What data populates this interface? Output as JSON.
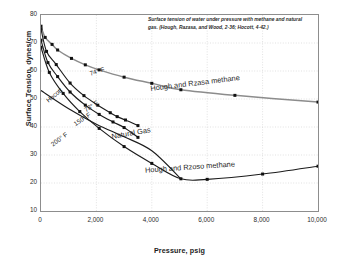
{
  "figure": {
    "caption": "Surface tension of water under pressure with methane and natural gas. (Hough, Razasa, and Wood, 2-36; Hocott, 4-42.)"
  },
  "chart_data": {
    "type": "line",
    "title": "",
    "xlabel": "Pressure, psig",
    "ylabel": "Surface Tension, dynes/cm",
    "xlim": [
      0,
      10000
    ],
    "ylim": [
      10,
      80
    ],
    "xticks": [
      "0",
      "2,000",
      "4,000",
      "6,000",
      "8,000",
      "10,000"
    ],
    "xtick_values": [
      0,
      2000,
      4000,
      6000,
      8000,
      10000
    ],
    "yticks": [
      "10",
      "20",
      "30",
      "40",
      "50",
      "60",
      "70",
      "80"
    ],
    "ytick_values": [
      10,
      20,
      30,
      40,
      50,
      60,
      70,
      80
    ],
    "grid": "dotted",
    "legend": "inline-annotations",
    "colors": {
      "methane_74F": "#8c8c8c",
      "dark_curves": "#1c1c1c",
      "frame": "#8d8d8d",
      "gridline": "#cfcfcf",
      "marker": "#111111"
    },
    "series": [
      {
        "name": "Hough and Rzasa methane",
        "label": "74° F",
        "color": "#8c8c8c",
        "markers": true,
        "points": [
          [
            0,
            76.0
          ],
          [
            150,
            72.0
          ],
          [
            400,
            69.5
          ],
          [
            600,
            67.5
          ],
          [
            1100,
            64.5
          ],
          [
            1600,
            62.2
          ],
          [
            2100,
            60.4
          ],
          [
            3000,
            57.8
          ],
          [
            4000,
            55.6
          ],
          [
            5050,
            53.3
          ],
          [
            7000,
            51.3
          ],
          [
            10000,
            48.9
          ]
        ]
      },
      {
        "name": "Hocott 78 F",
        "label": "78° F",
        "color": "#1c1c1c",
        "markers": true,
        "points": [
          [
            0,
            75.0
          ],
          [
            200,
            67.0
          ],
          [
            550,
            62.3
          ],
          [
            1050,
            55.7
          ],
          [
            1550,
            51.2
          ],
          [
            2050,
            47.8
          ],
          [
            2500,
            45.1
          ],
          [
            2750,
            43.7
          ],
          [
            3050,
            42.5
          ],
          [
            3500,
            40.5
          ]
        ]
      },
      {
        "name": "Hocott 150 F",
        "label": "150° F",
        "color": "#1c1c1c",
        "markers": true,
        "points": [
          [
            0,
            71.0
          ],
          [
            250,
            63.0
          ],
          [
            600,
            58.0
          ],
          [
            1050,
            52.5
          ],
          [
            1600,
            47.8
          ],
          [
            2100,
            44.5
          ],
          [
            2600,
            41.8
          ],
          [
            3000,
            39.8
          ],
          [
            3500,
            36.3
          ]
        ]
      },
      {
        "name": "Hough and Rzoso methane",
        "label": "200° F",
        "color": "#1c1c1c",
        "markers": true,
        "points": [
          [
            0,
            68.5
          ],
          [
            300,
            59.5
          ],
          [
            800,
            52.0
          ],
          [
            1400,
            45.5
          ],
          [
            2100,
            39.5
          ],
          [
            3000,
            33.0
          ],
          [
            4000,
            27.0
          ],
          [
            5050,
            21.5
          ],
          [
            6000,
            21.3
          ],
          [
            8000,
            23.2
          ],
          [
            10000,
            26.0
          ]
        ]
      },
      {
        "name": "Natural Gas baseline",
        "label": "Natural Gas",
        "color": "#1c1c1c",
        "markers": false,
        "points": [
          [
            0,
            53.0
          ],
          [
            1000,
            46.5
          ],
          [
            2000,
            41.0
          ],
          [
            3000,
            36.5
          ],
          [
            4000,
            31.5
          ],
          [
            5050,
            21.5
          ]
        ]
      }
    ],
    "annotations": [
      {
        "text": "74° F",
        "x": 2050,
        "y": 59.5,
        "rotate": -17,
        "size": "small"
      },
      {
        "text": "78° F",
        "x": 1850,
        "y": 47.0,
        "rotate": -33,
        "size": "small"
      },
      {
        "text": "150° F",
        "x": 1500,
        "y": 42.5,
        "rotate": -33,
        "size": "small"
      },
      {
        "text": "200° F",
        "x": 700,
        "y": 35.5,
        "rotate": -37,
        "size": "small"
      },
      {
        "text": "Hocott",
        "x": 500,
        "y": 51.0,
        "rotate": -40,
        "size": "small"
      },
      {
        "text": "Natural Gas",
        "x": 3300,
        "y": 37.5,
        "rotate": -10,
        "size": "large"
      },
      {
        "text": "Hough and Rzasa methane",
        "x": 5600,
        "y": 55.5,
        "rotate": -7,
        "size": "large"
      },
      {
        "text": "Hough and Rzoso methane",
        "x": 5400,
        "y": 25.5,
        "rotate": -4,
        "size": "large"
      }
    ]
  }
}
